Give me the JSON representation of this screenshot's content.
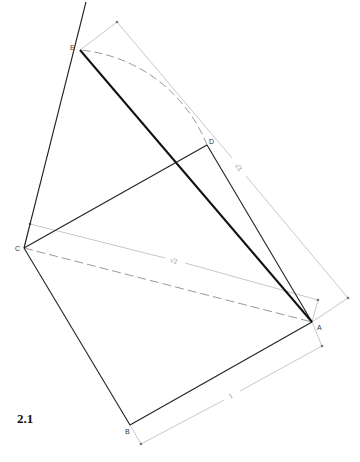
{
  "figure": {
    "label": "2.1"
  },
  "points": {
    "A": {
      "label": "A",
      "x": 312,
      "y": 322
    },
    "B": {
      "label": "B",
      "x": 130,
      "y": 425
    },
    "C": {
      "label": "C",
      "x": 24,
      "y": 248
    },
    "D": {
      "label": "D",
      "x": 207,
      "y": 145
    },
    "E": {
      "label": "E",
      "x": 80,
      "y": 50
    }
  },
  "dimensions": {
    "side_AB": {
      "label": "1"
    },
    "diagonal_AC": {
      "label": "√2"
    },
    "diagonal_AE": {
      "label": "√3"
    }
  },
  "colors": {
    "solid": "#222222",
    "bold": "#111111",
    "dashed": "#999999",
    "construction": "#c8c8c8"
  }
}
